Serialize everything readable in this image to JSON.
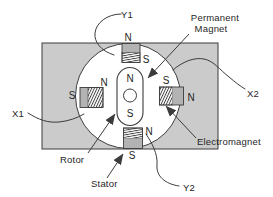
{
  "labels": {
    "y1": "Y1",
    "x1": "X1",
    "x2": "X2",
    "y2": "Y2",
    "permanent_magnet_1": "Permanent",
    "permanent_magnet_2": "Magnet",
    "electromagnet": "Electromagnet",
    "rotor": "Rotor",
    "stator": "Stator"
  },
  "poles": {
    "top_outer": "N",
    "top_inner": "S",
    "left_inner": "N",
    "left_outer": "S",
    "right_inner": "S",
    "right_outer": "N",
    "bottom_inner": "N",
    "bottom_outer": "S",
    "rotor_top": "N",
    "rotor_bottom": "S"
  },
  "colors": {
    "stator_fill": "#cbcbcb",
    "magnet_fill": "#b3b3b3",
    "line": "#3c3c3c",
    "text": "#1f1f1f",
    "paper": "#ffffff"
  }
}
